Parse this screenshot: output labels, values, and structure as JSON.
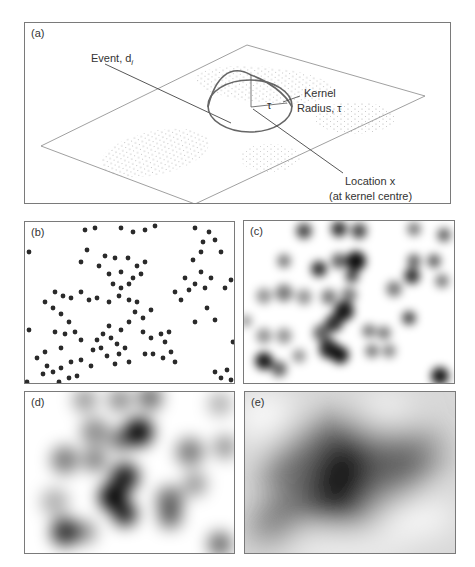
{
  "figure": {
    "panels": [
      {
        "id": "a",
        "label": "(a)",
        "description": "3D kernel density illustration"
      },
      {
        "id": "b",
        "label": "(b)",
        "description": "Point events"
      },
      {
        "id": "c",
        "label": "(c)",
        "description": "Density surface, small bandwidth"
      },
      {
        "id": "d",
        "label": "(d)",
        "description": "Density surface, medium bandwidth"
      },
      {
        "id": "e",
        "label": "(e)",
        "description": "Density surface, large bandwidth"
      }
    ],
    "annotations": {
      "event": "Event, d",
      "event_subscript": "i",
      "kernel": "Kernel",
      "radius": "Radius, τ",
      "tau": "τ",
      "location": "Location x",
      "location_note": "(at kernel centre)"
    },
    "colors": {
      "border": "#7a7a7a",
      "ink": "#333333",
      "dots": "#8a8a8a",
      "cone": "#666666"
    }
  }
}
